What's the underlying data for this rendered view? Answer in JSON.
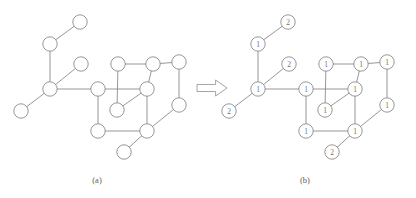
{
  "figure": {
    "type": "graph-transformation-diagram",
    "background_color": "#ffffff",
    "stroke_color": "#8b8b8b",
    "label_color": "#6f6f6f",
    "captions": [
      {
        "id": "caption-a",
        "text": "(a)",
        "x": 97,
        "y": 180
      },
      {
        "id": "caption-b",
        "text": "(b)",
        "x": 305,
        "y": 180
      }
    ],
    "arrow": {
      "name": "transformation-arrow",
      "direction": "right",
      "x": 197,
      "y": 88,
      "width": 30,
      "height": 16
    },
    "panels": [
      {
        "id": "panel-a",
        "caption": "(a)",
        "labels_shown": false,
        "nodes": [
          {
            "id": "a-t1",
            "x": 80,
            "y": 22,
            "label": ""
          },
          {
            "id": "a-t2",
            "x": 50,
            "y": 44,
            "label": ""
          },
          {
            "id": "a-t3",
            "x": 81,
            "y": 64,
            "label": ""
          },
          {
            "id": "a-t4",
            "x": 50,
            "y": 89,
            "label": ""
          },
          {
            "id": "a-t5",
            "x": 21,
            "y": 111,
            "label": ""
          },
          {
            "id": "a-c1",
            "x": 98,
            "y": 89,
            "label": ""
          },
          {
            "id": "a-c2",
            "x": 118,
            "y": 64,
            "label": ""
          },
          {
            "id": "a-c3",
            "x": 153,
            "y": 64,
            "label": ""
          },
          {
            "id": "a-c4",
            "x": 147,
            "y": 89,
            "label": ""
          },
          {
            "id": "a-c5",
            "x": 117,
            "y": 110,
            "label": ""
          },
          {
            "id": "a-c6",
            "x": 98,
            "y": 131,
            "label": ""
          },
          {
            "id": "a-c7",
            "x": 147,
            "y": 131,
            "label": ""
          },
          {
            "id": "a-r1",
            "x": 179,
            "y": 62,
            "label": ""
          },
          {
            "id": "a-r2",
            "x": 179,
            "y": 105,
            "label": ""
          },
          {
            "id": "a-p1",
            "x": 124,
            "y": 152,
            "label": ""
          }
        ],
        "edges": [
          [
            "a-t1",
            "a-t2"
          ],
          [
            "a-t2",
            "a-t4"
          ],
          [
            "a-t3",
            "a-t4"
          ],
          [
            "a-t4",
            "a-t5"
          ],
          [
            "a-t4",
            "a-c1"
          ],
          [
            "a-c1",
            "a-c4"
          ],
          [
            "a-c1",
            "a-c6"
          ],
          [
            "a-c2",
            "a-c3"
          ],
          [
            "a-c2",
            "a-c5"
          ],
          [
            "a-c3",
            "a-c4"
          ],
          [
            "a-c4",
            "a-c5"
          ],
          [
            "a-c4",
            "a-c7"
          ],
          [
            "a-c6",
            "a-c7"
          ],
          [
            "a-c3",
            "a-r1"
          ],
          [
            "a-r1",
            "a-r2"
          ],
          [
            "a-r2",
            "a-c7"
          ],
          [
            "a-c7",
            "a-p1"
          ]
        ]
      },
      {
        "id": "panel-b",
        "caption": "(b)",
        "labels_shown": true,
        "nodes": [
          {
            "id": "b-t1",
            "x": 288,
            "y": 22,
            "label": "2"
          },
          {
            "id": "b-t2",
            "x": 258,
            "y": 44,
            "label": "1"
          },
          {
            "id": "b-t3",
            "x": 289,
            "y": 64,
            "label": "2"
          },
          {
            "id": "b-t4",
            "x": 258,
            "y": 89,
            "label": "1"
          },
          {
            "id": "b-t5",
            "x": 229,
            "y": 111,
            "label": "2"
          },
          {
            "id": "b-c1",
            "x": 306,
            "y": 89,
            "label": "1"
          },
          {
            "id": "b-c2",
            "x": 326,
            "y": 64,
            "label": "1"
          },
          {
            "id": "b-c3",
            "x": 361,
            "y": 64,
            "label": "1"
          },
          {
            "id": "b-c4",
            "x": 355,
            "y": 89,
            "label": "1"
          },
          {
            "id": "b-c5",
            "x": 325,
            "y": 110,
            "label": "1"
          },
          {
            "id": "b-c6",
            "x": 306,
            "y": 131,
            "label": "1"
          },
          {
            "id": "b-c7",
            "x": 355,
            "y": 131,
            "label": "1"
          },
          {
            "id": "b-r1",
            "x": 387,
            "y": 62,
            "label": "1"
          },
          {
            "id": "b-r2",
            "x": 387,
            "y": 105,
            "label": "1"
          },
          {
            "id": "b-p1",
            "x": 332,
            "y": 152,
            "label": "2"
          }
        ],
        "edges": [
          [
            "b-t1",
            "b-t2"
          ],
          [
            "b-t2",
            "b-t4"
          ],
          [
            "b-t3",
            "b-t4"
          ],
          [
            "b-t4",
            "b-t5"
          ],
          [
            "b-t4",
            "b-c1"
          ],
          [
            "b-c1",
            "b-c4"
          ],
          [
            "b-c1",
            "b-c6"
          ],
          [
            "b-c2",
            "b-c3"
          ],
          [
            "b-c2",
            "b-c5"
          ],
          [
            "b-c3",
            "b-c4"
          ],
          [
            "b-c4",
            "b-c5"
          ],
          [
            "b-c4",
            "b-c7"
          ],
          [
            "b-c6",
            "b-c7"
          ],
          [
            "b-c3",
            "b-r1"
          ],
          [
            "b-r1",
            "b-r2"
          ],
          [
            "b-r2",
            "b-c7"
          ],
          [
            "b-c7",
            "b-p1"
          ]
        ]
      }
    ],
    "node_radius": 7.2
  }
}
